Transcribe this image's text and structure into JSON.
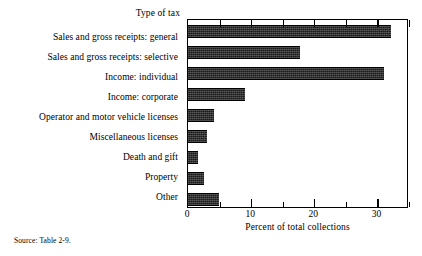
{
  "chart_data": {
    "type": "bar",
    "orientation": "horizontal",
    "title": "",
    "xlabel": "Percent of total collections",
    "ylabel": "Type of tax",
    "xlim": [
      0,
      35
    ],
    "ylim": null,
    "grid": false,
    "legend": null,
    "xticks_major": [
      0,
      10,
      20,
      30
    ],
    "xticks_minor": [
      5,
      15,
      25,
      35
    ],
    "xtick_labels": [
      "0",
      "10",
      "20",
      "30"
    ],
    "categories": [
      "Sales and gross receipts: general",
      "Sales and gross receipts: selective",
      "Income: individual",
      "Income: corporate",
      "Operator and motor vehicle licenses",
      "Miscellaneous licenses",
      "Death and gift",
      "Property",
      "Other"
    ],
    "values": [
      32.1,
      17.8,
      31.0,
      9.0,
      4.1,
      3.0,
      1.6,
      2.6,
      4.9
    ],
    "series": [
      {
        "name": "Percent of total collections",
        "values": [
          32.1,
          17.8,
          31.0,
          9.0,
          4.1,
          3.0,
          1.6,
          2.6,
          4.9
        ]
      }
    ],
    "bar_color": "#1a1a1a",
    "annotations": []
  },
  "labels": {
    "category_axis_title": "Type of tax",
    "x_axis_title": "Percent of total collections",
    "source_note": "Source: Table 2-9."
  }
}
